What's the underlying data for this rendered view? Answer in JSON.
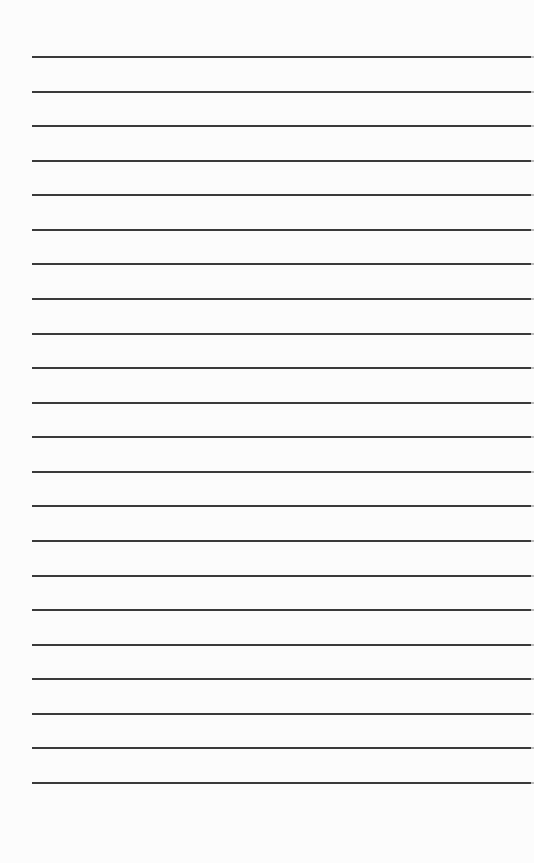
{
  "page": {
    "type": "lined-paper",
    "background_color": "#fcfcfc",
    "line_color": "#3a3a3a",
    "line_count": 22,
    "first_line_y": 56,
    "line_spacing": 34.57,
    "line_left": 32,
    "line_width": 499,
    "lines": [
      "",
      "",
      "",
      "",
      "",
      "",
      "",
      "",
      "",
      "",
      "",
      "",
      "",
      "",
      "",
      "",
      "",
      "",
      "",
      "",
      "",
      ""
    ]
  }
}
